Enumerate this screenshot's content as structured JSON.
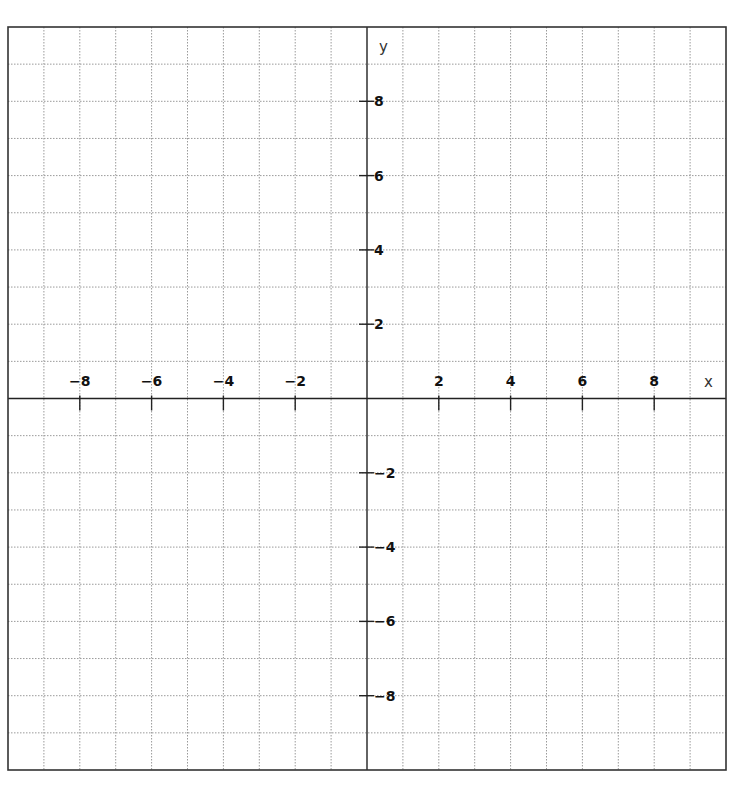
{
  "chart_data": {
    "type": "scatter",
    "title": "",
    "xlabel": "x",
    "ylabel": "y",
    "xlim": [
      -10,
      10
    ],
    "ylim": [
      -10,
      10
    ],
    "grid": true,
    "grid_step": 1,
    "x_ticks": [
      -8,
      -6,
      -4,
      -2,
      2,
      4,
      6,
      8
    ],
    "y_ticks": [
      8,
      6,
      4,
      2,
      -2,
      -4,
      -6,
      -8
    ],
    "x_tick_labels": [
      "−8",
      "−6",
      "−4",
      "−2",
      "2",
      "4",
      "6",
      "8"
    ],
    "y_tick_labels": [
      "8",
      "6",
      "4",
      "2",
      "−2",
      "−4",
      "−6",
      "−8"
    ],
    "series": [],
    "legend": null
  },
  "layout": {
    "left": 8,
    "top": 27,
    "right": 726,
    "bottom": 770,
    "colors": {
      "grid": "#9a9a9a",
      "axis": "#222222",
      "border": "#333333",
      "background": "#ffffff"
    }
  }
}
